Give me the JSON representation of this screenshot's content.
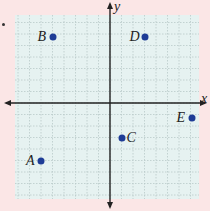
{
  "figure": {
    "axis_labels": {
      "x": "x",
      "y": "y"
    },
    "grid": {
      "cells": 16,
      "range": [
        -8,
        8
      ]
    },
    "colors": {
      "background": "#fbe6e6",
      "grid_fill": "#e6f2f1",
      "grid_line": "#b9c9c9",
      "axis": "#222222",
      "point": "#1e3c96"
    }
  },
  "chart_data": {
    "type": "scatter",
    "title": "",
    "xlabel": "x",
    "ylabel": "y",
    "xlim": [
      -8,
      8
    ],
    "ylim": [
      -8,
      8
    ],
    "grid": true,
    "points": [
      {
        "label": "A",
        "x": -6,
        "y": -5
      },
      {
        "label": "B",
        "x": -5,
        "y": 6
      },
      {
        "label": "C",
        "x": 1,
        "y": -3
      },
      {
        "label": "D",
        "x": 3,
        "y": 6
      },
      {
        "label": "E",
        "x": 7,
        "y": -1
      }
    ]
  }
}
